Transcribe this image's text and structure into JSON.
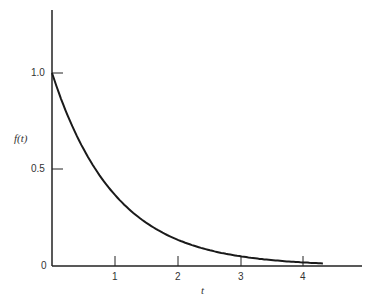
{
  "chart_data": {
    "type": "line",
    "title": "",
    "xlabel": "t",
    "ylabel": "f(t)",
    "x_ticks": [
      "1",
      "2",
      "3",
      "4"
    ],
    "y_ticks": [
      "0",
      "0.5",
      "1.0"
    ],
    "xlim": [
      0,
      4.9
    ],
    "ylim": [
      0,
      1.3
    ],
    "grid": false,
    "legend": null,
    "series": [
      {
        "name": "f(t) = e^-t",
        "x": [
          0,
          0.25,
          0.5,
          0.75,
          1.0,
          1.5,
          2.0,
          2.5,
          3.0,
          3.5,
          4.0,
          4.3
        ],
        "values": [
          1.0,
          0.779,
          0.607,
          0.472,
          0.368,
          0.223,
          0.135,
          0.082,
          0.05,
          0.03,
          0.018,
          0.014
        ]
      }
    ]
  },
  "axes": {
    "x_label": "t",
    "y_label": "f(t)",
    "origin_label": "0",
    "y_tick_labels": {
      "half": "0.5",
      "one": "1.0"
    },
    "x_tick_labels": [
      "1",
      "2",
      "3",
      "4"
    ]
  },
  "colors": {
    "line": "#1a1a1a",
    "axis": "#222222",
    "text": "#333333"
  }
}
